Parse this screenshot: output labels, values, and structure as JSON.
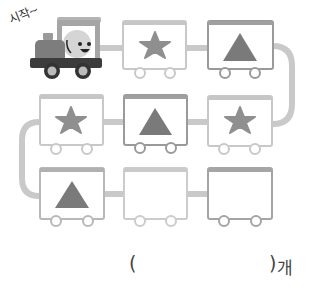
{
  "start_label": "시작~",
  "answer": {
    "open_paren": "(",
    "close_paren": ")",
    "unit": "개",
    "value": ""
  },
  "colors": {
    "track": "#c9c9c9",
    "car_border_light": "#c8c8c8",
    "car_border_dark": "#9a9a9a",
    "car_roof_light": "#c6c6c6",
    "car_roof_dark": "#a0a0a0",
    "shape_fill": "#8f8f8f",
    "triangle_fill": "#7a7a7a",
    "engine_body": "#7d7d7d",
    "engine_cab": "#a5a5a5",
    "engine_chassis": "#3c3c3c"
  },
  "train": {
    "rows": [
      {
        "cars": [
          {
            "shape": "star",
            "style": "light"
          },
          {
            "shape": "triangle",
            "style": "dark"
          }
        ]
      },
      {
        "cars": [
          {
            "shape": "star",
            "style": "light"
          },
          {
            "shape": "triangle",
            "style": "dark"
          },
          {
            "shape": "star",
            "style": "light"
          }
        ]
      },
      {
        "cars": [
          {
            "shape": "triangle",
            "style": "light"
          },
          {
            "shape": "empty",
            "style": "light"
          },
          {
            "shape": "empty",
            "style": "dark"
          }
        ]
      }
    ]
  }
}
